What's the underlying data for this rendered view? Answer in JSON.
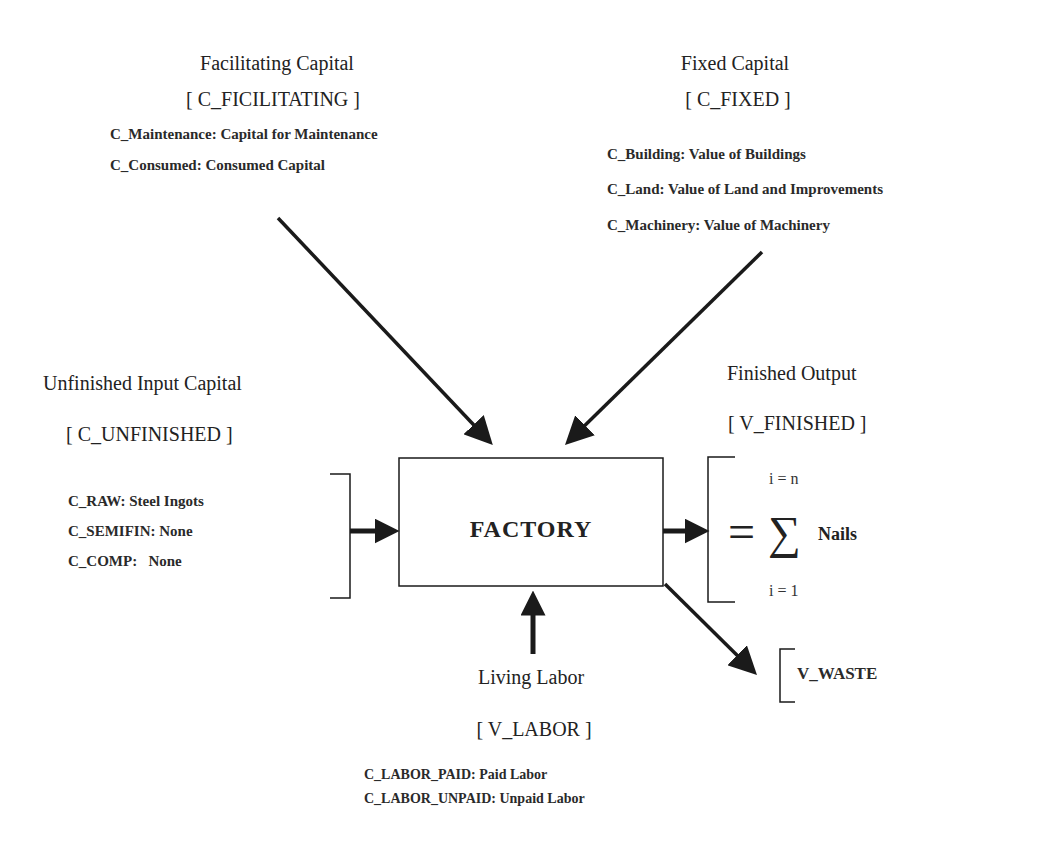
{
  "facilitating": {
    "title": "Facilitating Capital",
    "tag": "[ C_FICILITATING ]",
    "items": [
      "C_Maintenance: Capital for Maintenance",
      "C_Consumed: Consumed Capital"
    ]
  },
  "fixed": {
    "title": "Fixed Capital",
    "tag": "[ C_FIXED ]",
    "items": [
      "C_Building: Value of Buildings",
      "C_Land: Value of Land and Improvements",
      "C_Machinery: Value of Machinery"
    ]
  },
  "unfinished": {
    "title": "Unfinished Input Capital",
    "tag": "[ C_UNFINISHED ]",
    "items": [
      "C_RAW: Steel Ingots",
      "C_SEMIFIN: None",
      "C_COMP:   None"
    ]
  },
  "factory": {
    "label": "FACTORY"
  },
  "finished": {
    "title": "Finished Output",
    "tag": "[ V_FINISHED ]",
    "upper_index": "i = n",
    "lower_index": "i = 1",
    "equals": "=",
    "sigma": "∑",
    "term": "Nails"
  },
  "waste": {
    "label": "V_WASTE"
  },
  "labor": {
    "title": "Living Labor",
    "tag": "[ V_LABOR ]",
    "items": [
      "C_LABOR_PAID: Paid Labor",
      "C_LABOR_UNPAID: Unpaid Labor"
    ]
  },
  "colors": {
    "line": "#1a1a1a",
    "text": "#222222",
    "background": "#ffffff"
  }
}
